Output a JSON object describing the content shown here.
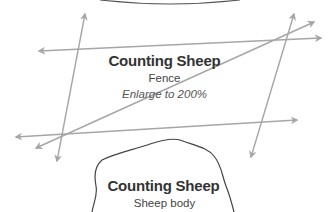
{
  "diagram": {
    "fence_card": {
      "title": "Counting Sheep",
      "subtitle": "Fence",
      "note": "Enlarge to 200%"
    },
    "body_card": {
      "title": "Counting Sheep",
      "subtitle": "Sheep body"
    },
    "colors": {
      "arrow": "#a6a6a6",
      "outline": "#444444",
      "text": "#333333"
    }
  }
}
